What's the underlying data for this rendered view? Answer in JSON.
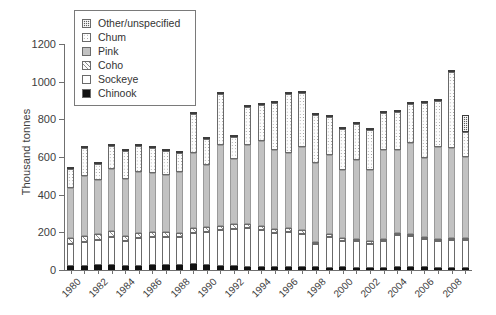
{
  "chart_data": {
    "type": "bar",
    "subtype": "stacked-vertical",
    "title": "",
    "xlabel": "",
    "ylabel": "Thousand tonnes",
    "ylim": [
      0,
      1200
    ],
    "yticks": [
      0,
      200,
      400,
      600,
      800,
      1000,
      1200
    ],
    "grid": false,
    "legend_position": "top-left-inside",
    "legend_order_top_to_bottom": [
      "Other/unspecified",
      "Chum",
      "Pink",
      "Coho",
      "Sockeye",
      "Chinook"
    ],
    "stack_order_bottom_to_top": [
      "Chinook",
      "Sockeye",
      "Coho",
      "Pink",
      "Chum",
      "Other/unspecified"
    ],
    "x": [
      1980,
      1981,
      1982,
      1983,
      1984,
      1985,
      1986,
      1987,
      1988,
      1989,
      1990,
      1991,
      1992,
      1993,
      1994,
      1995,
      1996,
      1997,
      1998,
      1999,
      2000,
      2001,
      2002,
      2003,
      2004,
      2005,
      2006,
      2007,
      2008,
      2009
    ],
    "xtick_labels": [
      "1980",
      "1982",
      "1984",
      "1986",
      "1988",
      "1990",
      "1992",
      "1994",
      "1996",
      "1998",
      "2000",
      "2002",
      "2004",
      "2006",
      "2008"
    ],
    "series": [
      {
        "name": "Chinook",
        "color": "#111111",
        "values": [
          22,
          21,
          24,
          26,
          23,
          22,
          24,
          26,
          27,
          30,
          24,
          22,
          20,
          18,
          16,
          16,
          17,
          15,
          14,
          13,
          14,
          13,
          12,
          12,
          14,
          15,
          14,
          12,
          11,
          10
        ]
      },
      {
        "name": "Sockeye",
        "color": "#ffffff",
        "values": [
          118,
          130,
          136,
          150,
          133,
          150,
          152,
          150,
          146,
          167,
          180,
          190,
          200,
          205,
          196,
          182,
          185,
          178,
          122,
          160,
          142,
          140,
          128,
          142,
          170,
          165,
          150,
          140,
          148,
          152
        ]
      },
      {
        "name": "Coho",
        "color": "#fbfbfb",
        "values": [
          30,
          28,
          30,
          32,
          26,
          26,
          28,
          26,
          25,
          26,
          24,
          22,
          22,
          22,
          21,
          20,
          20,
          18,
          14,
          16,
          14,
          13,
          12,
          12,
          14,
          13,
          12,
          11,
          10,
          10
        ]
      },
      {
        "name": "Pink",
        "color": "#c2c2c2",
        "values": [
          265,
          320,
          290,
          330,
          300,
          320,
          310,
          300,
          320,
          400,
          330,
          430,
          350,
          420,
          450,
          420,
          400,
          440,
          420,
          420,
          360,
          420,
          380,
          470,
          440,
          480,
          420,
          490,
          480,
          430
        ]
      },
      {
        "name": "Chum",
        "color": "#fdfdfd",
        "values": [
          100,
          148,
          82,
          120,
          148,
          142,
          135,
          128,
          105,
          203,
          140,
          270,
          112,
          200,
          192,
          250,
          310,
          290,
          255,
          205,
          220,
          190,
          210,
          196,
          200,
          210,
          290,
          245,
          400,
          130
        ]
      },
      {
        "name": "Other/unspecified",
        "color": "#5d5d5d",
        "values": [
          5,
          5,
          5,
          6,
          5,
          6,
          6,
          6,
          6,
          8,
          6,
          6,
          6,
          6,
          6,
          6,
          8,
          6,
          6,
          6,
          6,
          6,
          6,
          6,
          8,
          8,
          8,
          8,
          8,
          90
        ]
      }
    ],
    "totals": [
      540,
      652,
      567,
      664,
      635,
      666,
      655,
      636,
      629,
      834,
      704,
      940,
      710,
      871,
      881,
      894,
      940,
      947,
      831,
      820,
      756,
      782,
      748,
      838,
      846,
      891,
      894,
      906,
      1057,
      822
    ]
  }
}
